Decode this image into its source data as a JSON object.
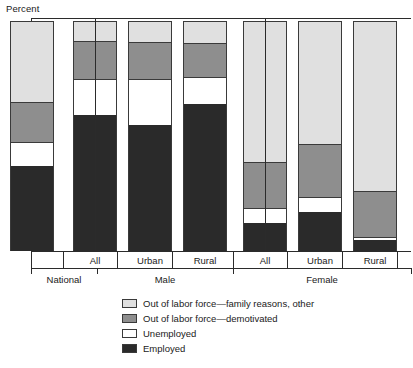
{
  "chart_data": {
    "type": "bar",
    "subtype": "stacked-bar",
    "title": "",
    "ylabel": "Percent",
    "xlabel": "",
    "ylim": [
      0,
      100
    ],
    "yticks": [
      10,
      20,
      30,
      40,
      50,
      60,
      70,
      80,
      90
    ],
    "grid": false,
    "legend_position": "bottom",
    "categories": [
      "National",
      "All",
      "Urban",
      "Rural",
      "All",
      "Urban",
      "Rural"
    ],
    "group_labels": [
      "National",
      "Male",
      "Female"
    ],
    "group_spans": [
      1,
      3,
      3
    ],
    "series": [
      {
        "name": "Employed",
        "color": "#2a2a2a",
        "values": [
          37,
          59,
          55,
          64,
          12,
          17,
          5
        ]
      },
      {
        "name": "Unemployed",
        "color": "#ffffff",
        "values": [
          10.5,
          16,
          20,
          11.5,
          6.5,
          6.5,
          1
        ]
      },
      {
        "name": "Out of labor force—demotivated",
        "color": "#8e8e8e",
        "values": [
          17.5,
          16.5,
          16,
          15,
          20,
          23,
          20
        ]
      },
      {
        "name": "Out of labor force—family reasons, other",
        "color": "#e0e0e0",
        "values": [
          35,
          8.5,
          9,
          9.5,
          61.5,
          53.5,
          74
        ]
      }
    ]
  },
  "axis": {
    "y_title": "Percent",
    "y_ticks": [
      "90",
      "80",
      "70",
      "60",
      "50",
      "40",
      "30",
      "20",
      "10"
    ]
  },
  "categories": [
    {
      "label": "National"
    },
    {
      "label": "All"
    },
    {
      "label": "Urban"
    },
    {
      "label": "Rural"
    },
    {
      "label": "All"
    },
    {
      "label": "Urban"
    },
    {
      "label": "Rural"
    }
  ],
  "groups": [
    {
      "label": "National"
    },
    {
      "label": "Male"
    },
    {
      "label": "Female"
    }
  ],
  "legend": {
    "items": [
      {
        "label": "Out of labor force—family reasons, other",
        "swatch": "family-swatch"
      },
      {
        "label": "Out of labor force—demotivated",
        "swatch": "demotivated-swatch"
      },
      {
        "label": "Unemployed",
        "swatch": "unemployed-swatch"
      },
      {
        "label": "Employed",
        "swatch": "employed-swatch"
      }
    ]
  }
}
